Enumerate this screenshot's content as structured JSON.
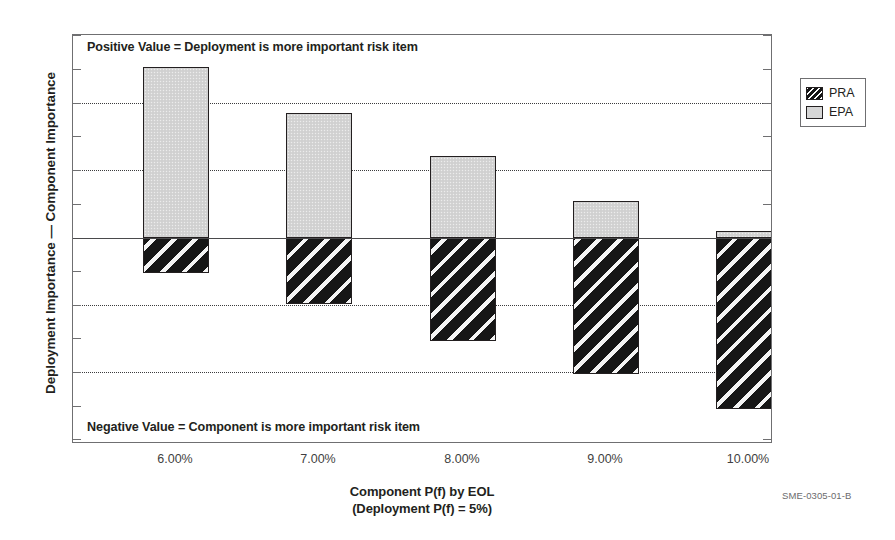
{
  "figure": {
    "id_label": "SME-0305-01-B",
    "y_axis_title": "Deployment Importance — Component Importance",
    "x_axis_title_line1": "Component P(f) by EOL",
    "x_axis_title_line2": "(Deployment P(f) = 5%)",
    "note_positive": "Positive Value = Deployment is more important risk item",
    "note_negative": "Negative Value = Component is more important risk item"
  },
  "legend": {
    "position": "right",
    "entries": [
      {
        "label": "PRA",
        "swatch": "hatched-diagonal-dark"
      },
      {
        "label": "EPA",
        "swatch": "solid-light-gray"
      }
    ]
  },
  "colors": {
    "epa_fill": "#d4d4d4",
    "pra_fill": "#161616",
    "bar_outline": "#231f20",
    "frame": "#6f6f71",
    "gridline": "#3b3b3d",
    "zero_line": "#4a4a4c",
    "text": "#231f20"
  },
  "chart_data": {
    "type": "bar",
    "title": "",
    "subtitle": "",
    "xlabel": "Component P(f) by EOL (Deployment P(f) = 5%)",
    "ylabel": "Deployment Importance — Component Importance",
    "categories": [
      "6.00%",
      "7.00%",
      "8.00%",
      "9.00%",
      "10.00%"
    ],
    "series": [
      {
        "name": "EPA",
        "values": [
          2.55,
          1.87,
          1.22,
          0.55,
          0.1
        ]
      },
      {
        "name": "PRA",
        "values": [
          -0.52,
          -0.99,
          -1.54,
          -2.03,
          -2.55
        ]
      }
    ],
    "stacked": true,
    "ylim": [
      -3.1,
      3.0
    ],
    "y_tick_interval": 0.5,
    "y_gridline_interval": 1.0,
    "y_tick_labels_shown": false,
    "grid": true,
    "legend_position": "right",
    "annotations": [
      "Positive Value = Deployment is more important risk item",
      "Negative Value = Component is more important risk item"
    ]
  },
  "layout": {
    "plot": {
      "left": 72,
      "top": 34,
      "width": 700,
      "height": 409
    },
    "zero_y": 203,
    "unit_px": 67,
    "tick_px": 33.5,
    "bar_width": 66,
    "bar_centers": [
      70,
      213,
      357,
      500,
      643
    ],
    "gridlines_y": [
      68,
      135,
      270,
      337
    ],
    "ticks_y": [
      0,
      34,
      68,
      101,
      135,
      169,
      203,
      236,
      270,
      303,
      337,
      371,
      404
    ]
  }
}
